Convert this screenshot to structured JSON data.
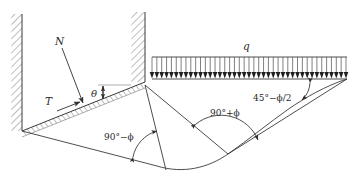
{
  "figure": {
    "name": "bearing-capacity-failure-mechanism",
    "background_color": "#ffffff",
    "line_color": "#3a3a3a",
    "text_color": "#2b2b2b",
    "hatch_color": "#6a6a6a"
  },
  "labels": {
    "normal_force": "N",
    "tangential_force": "T",
    "theta": "θ",
    "surcharge": "q",
    "angle_left": "90°−ϕ",
    "angle_mid": "90°+ϕ",
    "angle_right": "45°−ϕ/2"
  },
  "elements": {
    "left_wall": "hatched-vertical-wall-left",
    "right_wall": "hatched-vertical-wall-right",
    "slope_face": "hatched-inclined-slope-face",
    "load_strip": "distributed-load-q",
    "failure_surface": "log-spiral-failure-curve",
    "radial_line": "radial-wedge-line",
    "base_line": "wedge-base-line"
  },
  "load": {
    "tick_count": 41,
    "strip_x_start": 152,
    "strip_x_end": 346,
    "strip_top_y": 57,
    "strip_base_y": 79
  }
}
